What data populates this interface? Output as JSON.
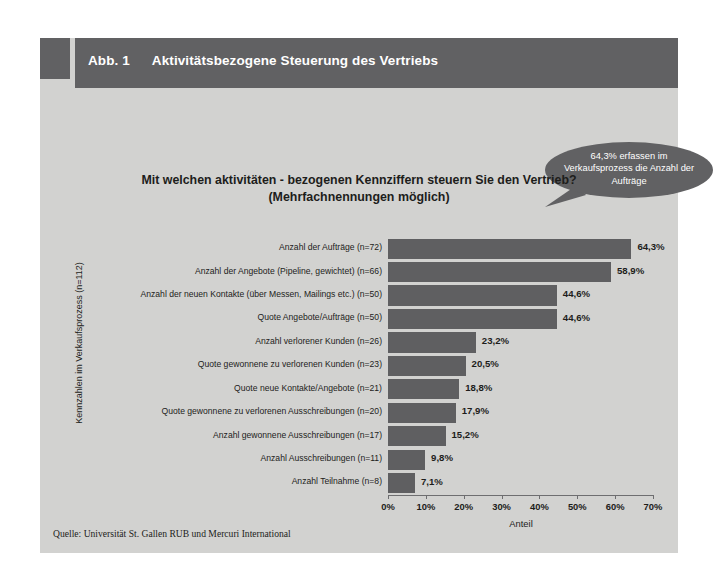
{
  "figure": {
    "number": "Abb. 1",
    "title": "Aktivitätsbezogene Steuerung des Vertriebs",
    "header_color": "#616163",
    "panel_color": "#d2d2d0"
  },
  "callout": {
    "text": "64,3% erfassen im Verkaufsprozess die Anzahl der Aufträge",
    "fill_color": "#616163",
    "text_color": "#ffffff"
  },
  "source": {
    "label": "Quelle: Universität St. Gallen RUB und Mercuri International"
  },
  "chart_data": {
    "type": "bar",
    "orientation": "horizontal",
    "title": "Mit welchen aktivitäten - bezogenen Kennziffern steuern Sie den Vertrieb?",
    "subtitle": "(Mehrfachnennungen möglich)",
    "xlabel": "Anteil",
    "ylabel": "Kennzahlen im Verkaufsprozess (n=112)",
    "xlim": [
      0,
      70
    ],
    "xticks": [
      0,
      10,
      20,
      30,
      40,
      50,
      60,
      70
    ],
    "xtick_labels": [
      "0%",
      "10%",
      "20%",
      "30%",
      "40%",
      "50%",
      "60%",
      "70%"
    ],
    "grid": false,
    "legend": "none",
    "bar_color": "#5f5f61",
    "categories": [
      "Anzahl der Aufträge (n=72)",
      "Anzahl der Angebote (Pipeline, gewichtet) (n=66)",
      "Anzahl der neuen Kontakte (über Messen, Mailings etc.) (n=50)",
      "Quote Angebote/Aufträge (n=50)",
      "Anzahl verlorener Kunden (n=26)",
      "Quote gewonnene zu verlorenen Kunden (n=23)",
      "Quote neue Kontakte/Angebote (n=21)",
      "Quote gewonnene zu verlorenen Ausschreibungen (n=20)",
      "Anzahl gewonnene Ausschreibungen (n=17)",
      "Anzahl Ausschreibungen (n=11)",
      "Anzahl Teilnahme (n=8)"
    ],
    "values": [
      64.3,
      58.9,
      44.6,
      44.6,
      23.2,
      20.5,
      18.8,
      17.9,
      15.2,
      9.8,
      7.1
    ],
    "value_labels": [
      "64,3%",
      "58,9%",
      "44,6%",
      "44,6%",
      "23,2%",
      "20,5%",
      "18,8%",
      "17,9%",
      "15,2%",
      "9,8%",
      "7,1%"
    ]
  }
}
